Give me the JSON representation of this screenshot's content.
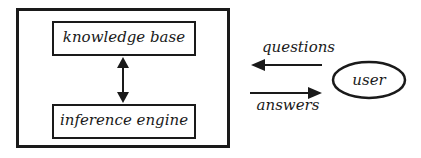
{
  "diagram": {
    "system": {
      "components": [
        {
          "label": "knowledge base"
        },
        {
          "label": "inference engine"
        }
      ],
      "link": "bidirectional"
    },
    "user": {
      "label": "user"
    },
    "flows": [
      {
        "label": "questions",
        "direction": "user-to-system"
      },
      {
        "label": "answers",
        "direction": "system-to-user"
      }
    ]
  }
}
